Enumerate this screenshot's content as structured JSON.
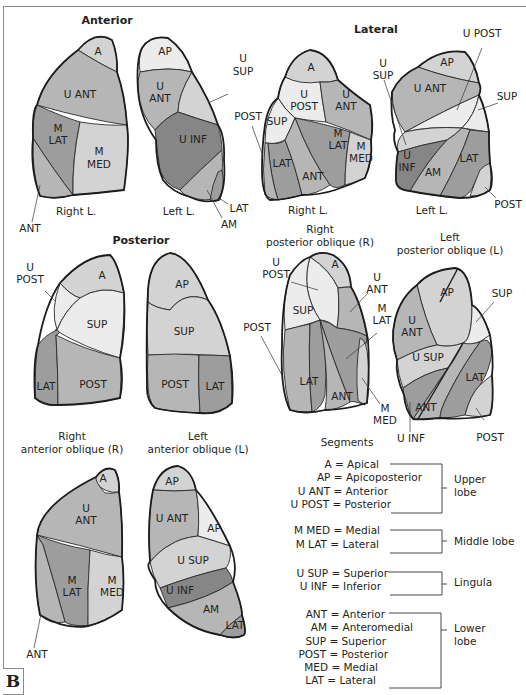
{
  "figure": {
    "panel_letter": "B",
    "views": {
      "anterior": {
        "title": "Anterior",
        "right_caption": "Right L.",
        "left_caption": "Left L.",
        "right_segments": [
          "A",
          "U ANT",
          "M",
          "LAT",
          "M",
          "MED",
          "ANT"
        ],
        "left_segments": [
          "AP",
          "U",
          "ANT",
          "U",
          "SUP",
          "U  INF",
          "LAT",
          "AM"
        ]
      },
      "lateral": {
        "title": "Lateral",
        "right_caption": "Right L.",
        "left_caption": "Left L.",
        "right_segments": [
          "A",
          "U",
          "POST",
          "U",
          "ANT",
          "SUP",
          "M",
          "LAT",
          "M",
          "MED",
          "LAT",
          "ANT",
          "POST"
        ],
        "left_segments": [
          "U POST",
          "U",
          "SUP",
          "AP",
          "U ANT",
          "SUP",
          "U",
          "INF",
          "AM",
          "LAT",
          "POST"
        ]
      },
      "posterior": {
        "title": "Posterior",
        "right_segments": [
          "U",
          "POST",
          "A",
          "SUP",
          "LAT",
          "POST"
        ],
        "left_segments": [
          "AP",
          "SUP",
          "POST",
          "LAT"
        ]
      },
      "rpo": {
        "title_line1": "Right",
        "title_line2": "posterior oblique (R)",
        "segments": [
          "U",
          "POST",
          "A",
          "U",
          "ANT",
          "M",
          "LAT",
          "SUP",
          "POST",
          "LAT",
          "ANT",
          "M",
          "MED"
        ]
      },
      "lpo": {
        "title_line1": "Left",
        "title_line2": "posterior oblique (L)",
        "segments": [
          "AP",
          "SUP",
          "U",
          "ANT",
          "U SUP",
          "LAT",
          "ANT",
          "U INF",
          "POST"
        ]
      },
      "rao": {
        "title_line1": "Right",
        "title_line2": "anterior oblique (R)",
        "segments": [
          "A",
          "U",
          "ANT",
          "M",
          "LAT",
          "M",
          "MED",
          "ANT"
        ]
      },
      "lao": {
        "title_line1": "Left",
        "title_line2": "anterior oblique (L)",
        "segments": [
          "AP",
          "U ANT",
          "AP",
          "U SUP",
          "U INF",
          "AM",
          "LAT"
        ]
      }
    },
    "legend": {
      "title": "Segments",
      "groups": [
        {
          "lobe_line1": "Upper",
          "lobe_line2": "lobe",
          "items": [
            "A = Apical",
            "AP = Apicoposterior",
            "U ANT = Anterior",
            "U POST = Posterior"
          ]
        },
        {
          "lobe_line1": "Middle lobe",
          "lobe_line2": "",
          "items": [
            "M MED = Medial",
            "M LAT = Lateral"
          ]
        },
        {
          "lobe_line1": "Lingula",
          "lobe_line2": "",
          "items": [
            "U SUP = Superior",
            "U INF = Inferior"
          ]
        },
        {
          "lobe_line1": "Lower",
          "lobe_line2": "lobe",
          "items": [
            "ANT = Anterior",
            "AM = Anteromedial",
            "SUP = Superior",
            "POST = Posterior",
            "MED = Medial",
            "LAT = Lateral"
          ]
        }
      ]
    },
    "colors": {
      "lightest": "#ececec",
      "light": "#d3d3d3",
      "medium": "#b6b6b6",
      "medium_dark": "#9d9d9d",
      "dark": "#868686",
      "outline": "#1c1c1c"
    }
  }
}
